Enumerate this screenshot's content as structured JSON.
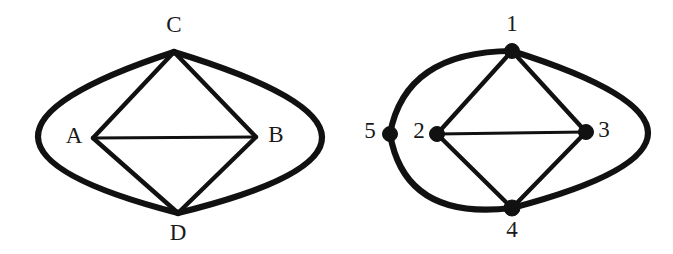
{
  "figure": {
    "background_color": "#ffffff",
    "stroke_color": "#111111",
    "width": 673,
    "height": 254
  },
  "graphs": [
    {
      "id": "left-graph",
      "name": "lettered-graph",
      "vertex_style": "no-dot",
      "vertices": [
        {
          "id": "A",
          "label": "A",
          "x": 93,
          "y": 138,
          "label_x": 74,
          "label_y": 138,
          "dot": false,
          "dot_r": 0
        },
        {
          "id": "B",
          "label": "B",
          "x": 256,
          "y": 137,
          "label_x": 276,
          "label_y": 137,
          "dot": false,
          "dot_r": 0
        },
        {
          "id": "C",
          "label": "C",
          "x": 174,
          "y": 52,
          "label_x": 174,
          "label_y": 27,
          "dot": false,
          "dot_r": 0
        },
        {
          "id": "D",
          "label": "D",
          "x": 178,
          "y": 213,
          "label_x": 178,
          "label_y": 235,
          "dot": false,
          "dot_r": 0
        }
      ],
      "edges": [
        {
          "from": "C",
          "to": "A",
          "kind": "straight",
          "weight": "medium"
        },
        {
          "from": "C",
          "to": "B",
          "kind": "straight",
          "weight": "medium"
        },
        {
          "from": "A",
          "to": "D",
          "kind": "straight",
          "weight": "medium"
        },
        {
          "from": "B",
          "to": "D",
          "kind": "straight",
          "weight": "medium"
        },
        {
          "from": "A",
          "to": "B",
          "kind": "straight",
          "weight": "thin"
        },
        {
          "from": "C",
          "to": "D",
          "kind": "curve-left",
          "weight": "thick",
          "via_x": 38,
          "via_y": 137
        },
        {
          "from": "C",
          "to": "D",
          "kind": "curve-right",
          "weight": "thick",
          "via_x": 322,
          "via_y": 137
        }
      ]
    },
    {
      "id": "right-graph",
      "name": "numbered-graph",
      "vertex_style": "filled-dot",
      "vertices": [
        {
          "id": "1",
          "label": "1",
          "x": 512,
          "y": 51,
          "label_x": 512,
          "label_y": 26,
          "dot": true,
          "dot_r": 7.5
        },
        {
          "id": "2",
          "label": "2",
          "x": 437,
          "y": 134,
          "label_x": 419,
          "label_y": 133,
          "dot": true,
          "dot_r": 7.5
        },
        {
          "id": "3",
          "label": "3",
          "x": 586,
          "y": 132,
          "label_x": 604,
          "label_y": 132,
          "dot": true,
          "dot_r": 7.5
        },
        {
          "id": "4",
          "label": "4",
          "x": 512,
          "y": 208,
          "label_x": 512,
          "label_y": 232,
          "dot": true,
          "dot_r": 8.0
        },
        {
          "id": "5",
          "label": "5",
          "x": 390,
          "y": 134,
          "label_x": 370,
          "label_y": 133,
          "dot": true,
          "dot_r": 7.5
        }
      ],
      "edges": [
        {
          "from": "1",
          "to": "2",
          "kind": "straight",
          "weight": "medium"
        },
        {
          "from": "1",
          "to": "3",
          "kind": "straight",
          "weight": "medium"
        },
        {
          "from": "2",
          "to": "4",
          "kind": "straight",
          "weight": "medium"
        },
        {
          "from": "3",
          "to": "4",
          "kind": "straight",
          "weight": "medium"
        },
        {
          "from": "2",
          "to": "3",
          "kind": "straight",
          "weight": "thin"
        },
        {
          "from": "1",
          "to": "5",
          "kind": "curve-left",
          "weight": "thick",
          "via_x": 428,
          "via_y": 72
        },
        {
          "from": "5",
          "to": "4",
          "kind": "curve-left",
          "weight": "thick",
          "via_x": 428,
          "via_y": 196
        },
        {
          "from": "1",
          "to": "4",
          "kind": "curve-right",
          "weight": "thick",
          "via_x": 648,
          "via_y": 133
        }
      ]
    }
  ]
}
